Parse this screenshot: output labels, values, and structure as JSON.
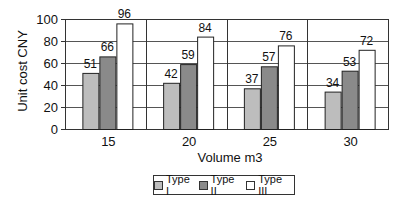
{
  "chart_data": {
    "type": "bar",
    "title": "",
    "xlabel": "Volume m3",
    "ylabel": "Unit cost CNY",
    "categories": [
      "15",
      "20",
      "25",
      "30"
    ],
    "series": [
      {
        "name": "Type I",
        "values": [
          51,
          42,
          37,
          34
        ],
        "color": "#bdbdbd"
      },
      {
        "name": "Type II",
        "values": [
          66,
          59,
          57,
          53
        ],
        "color": "#8a8a8a"
      },
      {
        "name": "Type III",
        "values": [
          96,
          84,
          76,
          72
        ],
        "color": "#ffffff"
      }
    ],
    "ylim": [
      0,
      100
    ],
    "yticks": [
      0,
      20,
      40,
      60,
      80,
      100
    ],
    "grid": true,
    "legend_position": "bottom",
    "data_labels": true
  },
  "legend": {
    "items": [
      {
        "label": "Type I",
        "color": "#bdbdbd"
      },
      {
        "label": "Type II",
        "color": "#8a8a8a"
      },
      {
        "label": "Type III",
        "color": "#ffffff"
      }
    ]
  }
}
